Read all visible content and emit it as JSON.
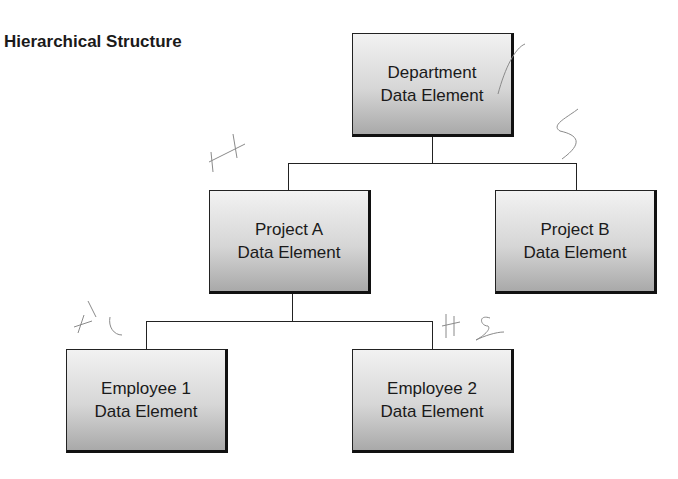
{
  "title": "Hierarchical Structure",
  "nodes": {
    "department": {
      "line1": "Department",
      "line2": "Data Element"
    },
    "project_a": {
      "line1": "Project A",
      "line2": "Data Element"
    },
    "project_b": {
      "line1": "Project B",
      "line2": "Data Element"
    },
    "employee_1": {
      "line1": "Employee 1",
      "line2": "Data Element"
    },
    "employee_2": {
      "line1": "Employee 2",
      "line2": "Data Element"
    }
  },
  "edges": [
    {
      "from": "department",
      "to": "project_a"
    },
    {
      "from": "department",
      "to": "project_b"
    },
    {
      "from": "project_a",
      "to": "employee_1"
    },
    {
      "from": "project_a",
      "to": "employee_2"
    }
  ],
  "annotations": {
    "handwritten": [
      "H",
      "S",
      "H1",
      "H2"
    ]
  }
}
